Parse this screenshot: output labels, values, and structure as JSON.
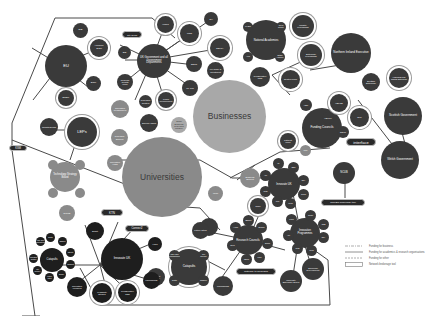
{
  "diagram": {
    "big_nodes": {
      "universities": "Universities",
      "businesses": "Businesses"
    },
    "groups": {
      "uk_government": "UK Government and all Government Departments",
      "eu": "EU",
      "leps": "LEPs",
      "technology_strategy_board": "Technology Strategy Board",
      "national_academies": "National Academies",
      "funding_councils": "Funding Councils",
      "innovate_uk": "Innovate UK",
      "research_councils": "Research Councils",
      "catapults": "Catapults",
      "catapult_network": "Catapults",
      "gateway": "Gateway to Research",
      "nioe": "Northern Ireland Executive",
      "scottish_government": "Scottish Government",
      "welsh_government": "Welsh Government",
      "ncub": "NCUB",
      "ktn": "KTN"
    },
    "tags": {
      "interface": "interface",
      "ncub_brokerage": "NCUB's brokerage tool",
      "catapult_tag": "Catapult",
      "ksm": "KSM",
      "innovation_ktn": "Innovate UK KTN",
      "ktn": "KTN",
      "connect": "Connect2"
    },
    "small_labels": {
      "eib": "EIB",
      "horizon": "Horizon 2020",
      "esif": "ESIF",
      "erdf": "ERDF",
      "growth_deals": "Growth Deals",
      "city_deals": "City Deals",
      "bis": "BIS",
      "regional_growth_fund": "Regional Growth Fund",
      "hmrc": "HMRC",
      "mod": "MOD",
      "dh": "DH",
      "defra": "DEFRA",
      "decc": "DECC",
      "uk_trade": "UK Trade & Investment",
      "uk_ipo": "UK IPO",
      "public_procurement": "Public Procurement",
      "research_centres": "Research Centres",
      "small_business": "Small Business Research Initiative",
      "science_parks": "Science Parks",
      "rai": "RAEng",
      "royal_society": "Royal Society",
      "british_academy": "British Academy",
      "ams": "AMS",
      "industry_fellowships": "Industry Fellowships",
      "enterprise_fellowships": "Enterprise Fellowships",
      "newton_fund": "Newton Fund",
      "hefce": "HEFCE",
      "hefcw": "HEFCW",
      "sfc": "SFC",
      "delni": "DELNI",
      "heif": "HEIF",
      "catalyst": "Catalyst Fund",
      "ukri": "UKRI",
      "ahrc": "AHRC",
      "bbsrc": "BBSRC",
      "epsrc": "EPSRC",
      "esrc": "ESRC",
      "mrc": "MRC",
      "nerc": "NERC",
      "stfc": "STFC",
      "innovate_centres": "Innovation Centres",
      "launchpads": "Launchpads",
      "smart": "Smart",
      "ktp": "KTPs",
      "innovation_vouchers": "Innovation Vouchers",
      "feasibility": "Feasibility Studies",
      "collaborative": "Collaborative R&D",
      "catapult_centres": "Catapult Centres",
      "hvm": "High Value Manufacturing",
      "cell_therapy": "Cell Therapy",
      "digital": "Digital",
      "offshore": "Offshore",
      "satellite": "Satellite",
      "transport": "Transport",
      "energy": "Energy",
      "future_cities": "Future Cities",
      "innovation_hubs": "Innovation Hubs",
      "business_support": "Business Support",
      "economic_dev": "Economic Development",
      "university_enterprise": "University Enterprise Zones",
      "dcms": "DCMS",
      "scottish_enterprise": "Scottish Enterprise",
      "highlands": "Highlands and Islands Enterprise",
      "invest_ni": "Invest NI",
      "nsb": "NSB",
      "innovation_programmes": "Innovation Programmes",
      "research_support": "Research Support",
      "ctu": "CTU",
      "pl": "PL",
      "sbri": "SBRI",
      "esa": "ESA",
      "iuk_group": "Group",
      "aim": "AIM",
      "sme": "SME",
      "isis": "ISIS",
      "iccs": "ICCS",
      "dstl": "DSTL"
    },
    "legend": [
      {
        "style": "dash-dot",
        "label": "Funding for business"
      },
      {
        "style": "solid",
        "label": "Funding for academics & research organisations"
      },
      {
        "style": "dashed",
        "label": "Funding for other"
      },
      {
        "style": "box",
        "label": "Network brokerage tool"
      }
    ],
    "colors": {
      "dark": "#3a3a3a",
      "mid": "#5a5a5a",
      "gray": "#8a8a8a",
      "light": "#a8a8a8",
      "black": "#1e1e1e",
      "line": "#4a4a4a"
    }
  }
}
